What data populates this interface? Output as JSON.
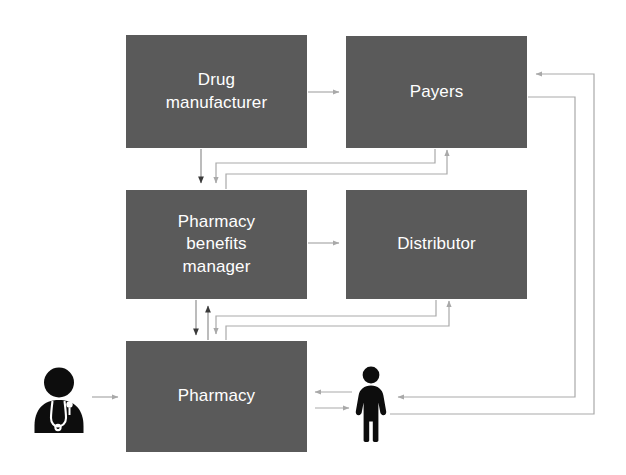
{
  "diagram": {
    "colors": {
      "node_fill": "#5a5a5a",
      "node_text": "#ffffff",
      "arrow": "#a9a9a9",
      "arrow_dark": "#3c3c3c",
      "icon": "#0d0d0d",
      "background": "#ffffff"
    },
    "nodes": [
      {
        "id": "drug_manufacturer",
        "label": "Drug\nmanufacturer"
      },
      {
        "id": "payers",
        "label": "Payers"
      },
      {
        "id": "pbm",
        "label": "Pharmacy\nbenefits\nmanager"
      },
      {
        "id": "distributor",
        "label": "Distributor"
      },
      {
        "id": "pharmacy",
        "label": "Pharmacy"
      }
    ],
    "actors": [
      {
        "id": "doctor",
        "icon": "doctor-icon",
        "label": ""
      },
      {
        "id": "patient",
        "icon": "patient-icon",
        "label": ""
      }
    ],
    "edges": [
      {
        "from": "drug_manufacturer",
        "to": "payers",
        "label": ""
      },
      {
        "from": "drug_manufacturer",
        "to": "pbm",
        "label": ""
      },
      {
        "from": "pbm",
        "to": "payers",
        "label": ""
      },
      {
        "from": "payers",
        "to": "pbm",
        "label": ""
      },
      {
        "from": "pbm",
        "to": "distributor",
        "label": ""
      },
      {
        "from": "pbm",
        "to": "pharmacy",
        "label": ""
      },
      {
        "from": "pharmacy",
        "to": "pbm",
        "label": ""
      },
      {
        "from": "pharmacy",
        "to": "distributor",
        "label": ""
      },
      {
        "from": "distributor",
        "to": "pharmacy",
        "label": ""
      },
      {
        "from": "doctor",
        "to": "pharmacy",
        "label": ""
      },
      {
        "from": "pharmacy",
        "to": "patient",
        "label": ""
      },
      {
        "from": "patient",
        "to": "pharmacy",
        "label": ""
      },
      {
        "from": "patient",
        "to": "payers",
        "label": ""
      },
      {
        "from": "payers",
        "to": "patient",
        "label": ""
      }
    ]
  }
}
